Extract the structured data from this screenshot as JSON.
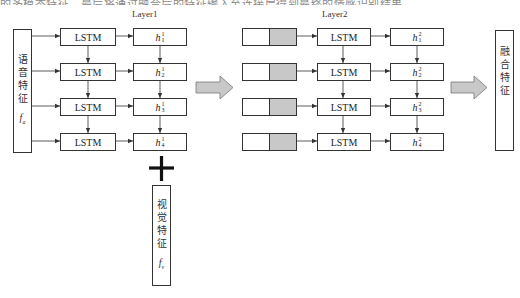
{
  "top_text_fragment": "的多模态特征，最后将通过融合后的特征输入至连接层得到最终的情感识别结果。",
  "layer1": {
    "label": "Layer1",
    "input_box": {
      "chars": [
        "语",
        "音",
        "特",
        "征"
      ],
      "symbol": "f",
      "symbol_sub": "a"
    },
    "lstm_cells": [
      "LSTM",
      "LSTM",
      "LSTM",
      "LSTM"
    ],
    "hidden_states": [
      {
        "base": "h",
        "sup": "1",
        "sub": "1"
      },
      {
        "base": "h",
        "sup": "1",
        "sub": "2"
      },
      {
        "base": "h",
        "sup": "1",
        "sub": "3"
      },
      {
        "base": "h",
        "sup": "1",
        "sub": "4"
      }
    ]
  },
  "plus_symbol": "+",
  "visual_box": {
    "chars": [
      "视",
      "觉",
      "特",
      "征"
    ],
    "symbol": "f",
    "symbol_sub": "v"
  },
  "layer2": {
    "label": "Layer2",
    "concat_inputs": [
      {
        "left_color": "#ffffff",
        "right_color": "#c8c8c8"
      },
      {
        "left_color": "#ffffff",
        "right_color": "#c8c8c8"
      },
      {
        "left_color": "#ffffff",
        "right_color": "#c8c8c8"
      },
      {
        "left_color": "#ffffff",
        "right_color": "#c8c8c8"
      }
    ],
    "lstm_cells": [
      "LSTM",
      "LSTM",
      "LSTM",
      "LSTM"
    ],
    "hidden_states": [
      {
        "base": "h",
        "sup": "2",
        "sub": "1"
      },
      {
        "base": "h",
        "sup": "2",
        "sub": "2"
      },
      {
        "base": "h",
        "sup": "2",
        "sub": "3"
      },
      {
        "base": "h",
        "sup": "2",
        "sub": "4"
      }
    ]
  },
  "output_box": {
    "chars": [
      "融",
      "合",
      "特",
      "征"
    ]
  },
  "colors": {
    "block_arrow_fill": "#c8c8c8",
    "block_arrow_stroke": "#777777",
    "line": "#333333"
  }
}
